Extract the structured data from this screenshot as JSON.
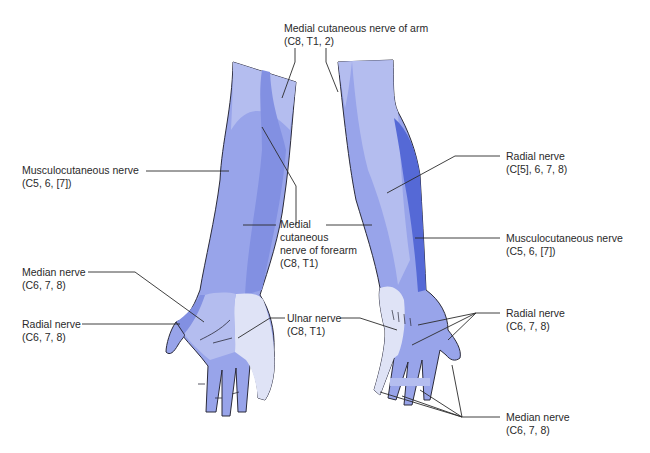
{
  "figure": {
    "colors": {
      "background": "#ffffff",
      "outline": "#2b2b3a",
      "leader_line": "#2b2b2b",
      "lightest": "#dfe3f6",
      "light": "#b4bdef",
      "mid": "#98a4ea",
      "medium_dark": "#8290e2",
      "dark": "#5569d6"
    },
    "labels": {
      "medial_cutaneous_arm": {
        "name": "Medial cutaneous nerve of arm",
        "roots": "(C8, T1, 2)"
      },
      "musculocutaneous_left": {
        "name": "Musculocutaneous nerve",
        "roots": "(C5, 6, [7])"
      },
      "medial_cutaneous_forearm": {
        "line1": "Medial",
        "line2": "cutaneous",
        "line3": "nerve of forearm",
        "roots": "(C8, T1)"
      },
      "median_left": {
        "name": "Median nerve",
        "roots": "(C6, 7, 8)"
      },
      "radial_left": {
        "name": "Radial nerve",
        "roots": "(C6, 7, 8)"
      },
      "ulnar": {
        "name": "Ulnar nerve",
        "roots": "(C8, T1)"
      },
      "radial_upper_right": {
        "name": "Radial nerve",
        "roots": "(C[5], 6, 7, 8)"
      },
      "musculocutaneous_right": {
        "name": "Musculocutaneous nerve",
        "roots": "(C5, 6, [7])"
      },
      "radial_hand_right": {
        "name": "Radial nerve",
        "roots": "(C6, 7, 8)"
      },
      "median_right": {
        "name": "Median nerve",
        "roots": "(C6, 7, 8)"
      }
    }
  }
}
